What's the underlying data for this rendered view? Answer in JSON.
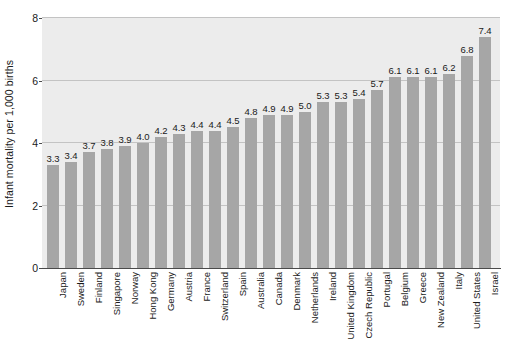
{
  "chart_data": {
    "type": "bar",
    "title": "",
    "subtitle": "",
    "xlabel": "",
    "ylabel": "Infant mortality per 1,000 births",
    "ylim": [
      0,
      8
    ],
    "yticks": [
      0,
      2,
      4,
      6,
      8
    ],
    "ytick_labels": [
      "0",
      "2",
      "4",
      "6",
      "8"
    ],
    "grid": true,
    "grid_axis": "y",
    "legend": false,
    "legend_position": "none",
    "bar_color": "#a6a6a6",
    "plot_background": "#ececec",
    "page_background": "#ffffff",
    "data_labels": true,
    "categories": [
      "Japan",
      "Sweden",
      "Finland",
      "Singapore",
      "Norway",
      "Hong Kong",
      "Germany",
      "Austria",
      "France",
      "Switzerland",
      "Spain",
      "Australia",
      "Canada",
      "Denmark",
      "Netherlands",
      "Ireland",
      "United Kingdom",
      "Czech Republic",
      "Portugal",
      "Belgium",
      "Greece",
      "New Zealand",
      "Italy",
      "United States",
      "Israel"
    ],
    "values": [
      3.3,
      3.4,
      3.7,
      3.8,
      3.9,
      4.0,
      4.2,
      4.3,
      4.4,
      4.4,
      4.5,
      4.8,
      4.9,
      4.9,
      5.0,
      5.3,
      5.3,
      5.4,
      5.7,
      6.1,
      6.1,
      6.1,
      6.2,
      6.8,
      7.4
    ],
    "value_labels": [
      "3.3",
      "3.4",
      "3.7",
      "3.8",
      "3.9",
      "4.0",
      "4.2",
      "4.3",
      "4.4",
      "4.4",
      "4.5",
      "4.8",
      "4.9",
      "4.9",
      "5.0",
      "5.3",
      "5.3",
      "5.4",
      "5.7",
      "6.1",
      "6.1",
      "6.1",
      "6.2",
      "6.8",
      "7.4"
    ]
  }
}
